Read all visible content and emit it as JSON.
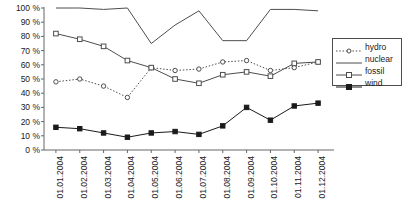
{
  "chart_data": {
    "type": "line",
    "title": "",
    "xlabel": "",
    "ylabel": "",
    "ylim": [
      0,
      100
    ],
    "ytick_step": 10,
    "ytick_suffix": " %",
    "grid": false,
    "legend_position": "right",
    "categories": [
      "01.01.2004",
      "01.02.2004",
      "01.03.2004",
      "01.04.2004",
      "01.05.2004",
      "01.06.2004",
      "01.07.2004",
      "01.08.2004",
      "01.09.2004",
      "01.10.2004",
      "01.11.2004",
      "01.12.2004"
    ],
    "yticks": [
      "0 %",
      "10 %",
      "20 %",
      "30 %",
      "40 %",
      "50 %",
      "60 %",
      "70 %",
      "80 %",
      "90 %",
      "100 %"
    ],
    "series": [
      {
        "name": "hydro",
        "marker": "open-circle",
        "line": "dotted",
        "color": "#4d4d4d",
        "values": [
          48,
          50,
          45,
          37,
          58,
          56,
          57,
          62,
          63,
          56,
          58,
          62
        ]
      },
      {
        "name": "nuclear",
        "marker": "none",
        "line": "solid",
        "color": "#4d4d4d",
        "values": [
          100,
          100,
          99,
          100,
          75,
          88,
          98,
          77,
          77,
          99,
          99,
          98
        ]
      },
      {
        "name": "fossil",
        "marker": "open-square",
        "line": "solid",
        "color": "#4d4d4d",
        "values": [
          82,
          78,
          73,
          63,
          58,
          50,
          47,
          53,
          55,
          52,
          61,
          62
        ]
      },
      {
        "name": "wind",
        "marker": "filled-square",
        "line": "solid",
        "color": "#1a1a1a",
        "values": [
          16,
          15,
          12,
          9,
          12,
          13,
          11,
          17,
          30,
          21,
          31,
          33
        ]
      }
    ]
  },
  "legend": {
    "entries": [
      {
        "label": "hydro"
      },
      {
        "label": "nuclear"
      },
      {
        "label": "fossil"
      },
      {
        "label": "wind"
      }
    ]
  }
}
